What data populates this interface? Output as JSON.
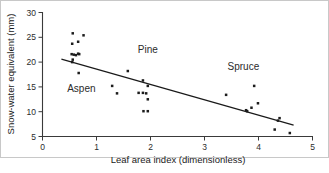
{
  "chart_data": {
    "type": "scatter",
    "title": "",
    "xlabel": "Leaf area index (dimensionless)",
    "ylabel": "Snow-water equivalent (mm)",
    "xlim": [
      0,
      5
    ],
    "ylim": [
      5,
      30
    ],
    "xticks": [
      0,
      1,
      2,
      3,
      4,
      5
    ],
    "yticks": [
      5,
      10,
      15,
      20,
      25,
      30
    ],
    "xtick_labels": [
      "0",
      "1",
      "2",
      "3",
      "4",
      "5"
    ],
    "ytick_labels": [
      "5",
      "10",
      "15",
      "20",
      "25",
      "30"
    ],
    "grid": false,
    "legend": "none",
    "marker": "square",
    "marker_color": "#1c1c1c",
    "points": [
      {
        "x": 0.56,
        "y": 25.8
      },
      {
        "x": 0.55,
        "y": 23.7
      },
      {
        "x": 0.66,
        "y": 24.1
      },
      {
        "x": 0.76,
        "y": 25.4
      },
      {
        "x": 0.54,
        "y": 21.6
      },
      {
        "x": 0.58,
        "y": 21.5
      },
      {
        "x": 0.62,
        "y": 21.4
      },
      {
        "x": 0.66,
        "y": 21.7
      },
      {
        "x": 0.68,
        "y": 21.6
      },
      {
        "x": 0.55,
        "y": 20.0
      },
      {
        "x": 0.56,
        "y": 20.5
      },
      {
        "x": 0.67,
        "y": 17.8
      },
      {
        "x": 1.29,
        "y": 15.2
      },
      {
        "x": 1.38,
        "y": 13.7
      },
      {
        "x": 1.58,
        "y": 18.2
      },
      {
        "x": 1.78,
        "y": 13.8
      },
      {
        "x": 1.86,
        "y": 16.3
      },
      {
        "x": 1.86,
        "y": 13.8
      },
      {
        "x": 1.92,
        "y": 13.7
      },
      {
        "x": 1.95,
        "y": 15.2
      },
      {
        "x": 1.95,
        "y": 12.5
      },
      {
        "x": 1.87,
        "y": 10.1
      },
      {
        "x": 1.95,
        "y": 10.1
      },
      {
        "x": 3.4,
        "y": 13.4
      },
      {
        "x": 3.77,
        "y": 10.3
      },
      {
        "x": 3.79,
        "y": 10.1
      },
      {
        "x": 3.87,
        "y": 10.8
      },
      {
        "x": 3.92,
        "y": 15.2
      },
      {
        "x": 3.99,
        "y": 11.7
      },
      {
        "x": 4.3,
        "y": 6.4
      },
      {
        "x": 4.36,
        "y": 8.2
      },
      {
        "x": 4.39,
        "y": 8.7
      },
      {
        "x": 4.58,
        "y": 5.7
      }
    ],
    "trend_line": {
      "type": "linear-fit",
      "x_start": 0.35,
      "y_start": 20.6,
      "x_end": 4.65,
      "y_end": 7.3
    },
    "annotations": [
      {
        "text": "Aspen",
        "x": 0.72,
        "y": 13.9
      },
      {
        "text": "Pine",
        "x": 1.95,
        "y": 21.9
      },
      {
        "text": "Spruce",
        "x": 3.72,
        "y": 18.4
      }
    ]
  },
  "caption": {
    "remnant": ""
  }
}
